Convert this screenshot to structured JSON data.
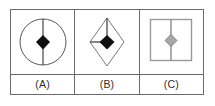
{
  "figure": {
    "type": "geometry-figure-panel",
    "cell_count": 3,
    "background_color": "#ffffff",
    "border_color": "#6b6b6b",
    "cells": [
      {
        "label": "(A)",
        "outer_shape": "circle",
        "outer_shape_color": "#555555",
        "inner_shape": "diamond",
        "inner_shape_fill": "#101010",
        "divider_line": "vertical-full",
        "divider_line_color": "#555555"
      },
      {
        "label": "(B)",
        "outer_shape": "rhombus",
        "outer_shape_color": "#7a7a7a",
        "inner_shape": "diamond",
        "inner_shape_fill": "#101010",
        "divider_line": "vertical-top-half-and-horizontal-left-half",
        "divider_line_color": "#3a3a3a"
      },
      {
        "label": "(C)",
        "outer_shape": "square",
        "outer_shape_color": "#9a9a9a",
        "inner_shape": "diamond",
        "inner_shape_fill": "#a8a8a8",
        "inner_shape_stroke": "#6f6f6f",
        "divider_line": "vertical-full",
        "divider_line_color": "#8a8a8a"
      }
    ]
  }
}
